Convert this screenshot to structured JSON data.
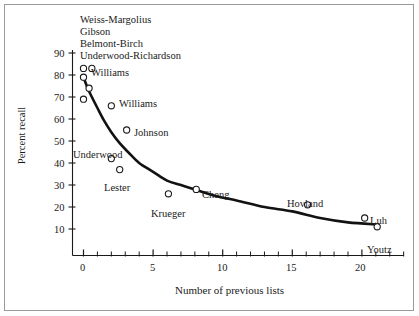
{
  "chart_data": {
    "type": "scatter",
    "title": "",
    "xlabel": "Number of previous lists",
    "ylabel": "Percent recall",
    "xlim": [
      -1.2,
      23.2
    ],
    "ylim": [
      0,
      95
    ],
    "grid": false,
    "legend": null,
    "x_ticks_major": [
      0,
      5,
      10,
      15,
      20
    ],
    "x_ticks_major_labels": [
      "0",
      "5",
      "10",
      "15",
      "20"
    ],
    "x_ticks_minor": [
      1,
      2,
      3,
      4,
      6,
      7,
      8,
      9,
      11,
      12,
      13,
      14,
      16,
      17,
      18,
      19,
      21,
      22,
      23
    ],
    "y_ticks": [
      10,
      20,
      30,
      40,
      50,
      60,
      70,
      80,
      90
    ],
    "y_tick_labels": [
      "10",
      "20",
      "30",
      "40",
      "50",
      "60",
      "70",
      "80",
      "90"
    ],
    "points": [
      {
        "label": "Weiss-Margolius",
        "x": 0.0,
        "y": 83,
        "label_pos": "top-stack"
      },
      {
        "label": "Gibson",
        "x": 0.6,
        "y": 83,
        "label_pos": "top-stack"
      },
      {
        "label": "Belmont-Birch",
        "x": 0.0,
        "y": 79,
        "label_pos": "top-stack"
      },
      {
        "label": "Underwood-Richardson",
        "x": 0.4,
        "y": 74,
        "label_pos": "top-stack"
      },
      {
        "label": "Williams",
        "x": 0.0,
        "y": 69,
        "label_pos": "right"
      },
      {
        "label": "Williams",
        "x": 2.0,
        "y": 66,
        "label_pos": "right"
      },
      {
        "label": "Johnson",
        "x": 3.1,
        "y": 55,
        "label_pos": "right"
      },
      {
        "label": "Underwood",
        "x": 2.0,
        "y": 42,
        "label_pos": "above-left"
      },
      {
        "label": "Lester",
        "x": 2.6,
        "y": 37,
        "label_pos": "below"
      },
      {
        "label": "Krueger",
        "x": 6.1,
        "y": 26,
        "label_pos": "below"
      },
      {
        "label": "Cheng",
        "x": 8.1,
        "y": 28,
        "label_pos": "right"
      },
      {
        "label": "Hovland",
        "x": 16.1,
        "y": 21,
        "label_pos": "above"
      },
      {
        "label": "Luh",
        "x": 20.2,
        "y": 15,
        "label_pos": "right"
      },
      {
        "label": "Youtz",
        "x": 21.1,
        "y": 11,
        "label_pos": "below"
      }
    ],
    "curve": {
      "description": "fitted decreasing exponential-like retroactive interference curve",
      "x_start": 0.0,
      "x_end": 21.2,
      "y_start": 79,
      "y_end": 12,
      "points": [
        [
          0.0,
          79
        ],
        [
          0.3,
          74
        ],
        [
          0.6,
          70
        ],
        [
          1.0,
          65
        ],
        [
          1.5,
          59
        ],
        [
          2.0,
          54
        ],
        [
          2.6,
          49
        ],
        [
          3.2,
          45
        ],
        [
          4.0,
          40
        ],
        [
          5.0,
          36
        ],
        [
          6.0,
          32
        ],
        [
          7.0,
          30
        ],
        [
          8.0,
          28
        ],
        [
          9.5,
          25
        ],
        [
          11.0,
          23
        ],
        [
          13.0,
          20
        ],
        [
          15.0,
          18
        ],
        [
          17.0,
          15
        ],
        [
          19.0,
          13
        ],
        [
          21.2,
          12
        ]
      ]
    },
    "top_labels": [
      "Weiss-Margolius",
      "Gibson",
      "Belmont-Birch",
      "Underwood-Richardson"
    ]
  },
  "axes": {
    "x_title": "Number of previous lists",
    "y_title": "Percent recall"
  }
}
